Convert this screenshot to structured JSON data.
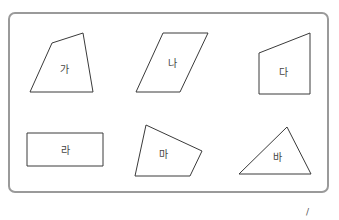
{
  "diagram": {
    "frame": {
      "border_color": "#9a9a9a",
      "background": "#ffffff"
    },
    "shapes": [
      {
        "id": "ga",
        "label": "가",
        "type": "quadrilateral",
        "points": "52,43 83,33 93,92 30,92",
        "label_pos": [
          64,
          69
        ]
      },
      {
        "id": "na",
        "label": "나",
        "type": "parallelogram",
        "points": "163,33 208,33 180,92 136,92",
        "label_pos": [
          172,
          63
        ]
      },
      {
        "id": "da",
        "label": "다",
        "type": "trapezoid",
        "points": "259,53 310,33 310,94 259,94",
        "label_pos": [
          283,
          72
        ]
      },
      {
        "id": "ra",
        "label": "라",
        "type": "rectangle",
        "points": "27,133 103,133 103,166 27,166",
        "label_pos": [
          65,
          150
        ]
      },
      {
        "id": "ma",
        "label": "마",
        "type": "quadrilateral",
        "points": "146,125 202,151 190,176 135,176",
        "label_pos": [
          163,
          154
        ]
      },
      {
        "id": "ba",
        "label": "바",
        "type": "triangle",
        "points": "287,127 311,174 239,174",
        "label_pos": [
          277,
          157
        ]
      }
    ],
    "corner_mark": "/"
  }
}
